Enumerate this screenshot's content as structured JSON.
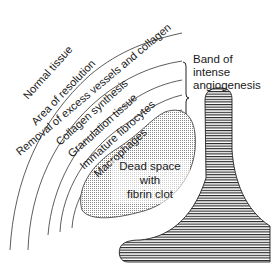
{
  "diagram": {
    "layers": [
      {
        "label": "Normal tissue"
      },
      {
        "label": "Area of resolution"
      },
      {
        "label": "Removal of excess vessels and collagen"
      },
      {
        "label": "Collagen synthesis"
      },
      {
        "label": "Granulation tissue"
      },
      {
        "label": "Immature fibrocytes"
      },
      {
        "label": "Macrophages"
      }
    ],
    "dead_space": {
      "line1": "Dead space",
      "line2": "with",
      "line3": "fibrin clot"
    },
    "band": {
      "line1": "Band of",
      "line2": "intense",
      "line3": "angiogenesis"
    }
  }
}
